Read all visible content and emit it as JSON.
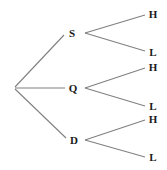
{
  "diagram": {
    "type": "probability-tree",
    "title": "",
    "background_color": "#ffffff",
    "edge_color": "#808080",
    "label_color": "#1a1a1a",
    "root": {
      "label": "",
      "x": 14,
      "y": 88
    },
    "level1": [
      {
        "id": "s",
        "label": "S",
        "x": 72,
        "y": 33,
        "fork_x": 85
      },
      {
        "id": "q",
        "label": "Q",
        "x": 73,
        "y": 88,
        "fork_x": 85
      },
      {
        "id": "d",
        "label": "D",
        "x": 74,
        "y": 140,
        "fork_x": 85
      }
    ],
    "level2": [
      {
        "id": "s-h",
        "parent": "s",
        "label": "H",
        "x": 153,
        "y": 14
      },
      {
        "id": "s-l",
        "parent": "s",
        "label": "L",
        "x": 153,
        "y": 52
      },
      {
        "id": "q-h",
        "parent": "q",
        "label": "H",
        "x": 153,
        "y": 67
      },
      {
        "id": "q-l",
        "parent": "q",
        "label": "L",
        "x": 153,
        "y": 106
      },
      {
        "id": "d-h",
        "parent": "d",
        "label": "H",
        "x": 153,
        "y": 119
      },
      {
        "id": "d-l",
        "parent": "d",
        "label": "L",
        "x": 153,
        "y": 157
      }
    ],
    "edges": [
      {
        "id": "root-s",
        "x1": 15,
        "y1": 87,
        "x2": 64,
        "y2": 35
      },
      {
        "id": "root-q",
        "x1": 15,
        "y1": 88,
        "x2": 65,
        "y2": 88
      },
      {
        "id": "root-d",
        "x1": 15,
        "y1": 89,
        "x2": 66,
        "y2": 138
      },
      {
        "id": "s-to-h",
        "x1": 85,
        "y1": 33,
        "x2": 145,
        "y2": 15
      },
      {
        "id": "s-to-l",
        "x1": 85,
        "y1": 33,
        "x2": 145,
        "y2": 51
      },
      {
        "id": "q-to-h",
        "x1": 85,
        "y1": 88,
        "x2": 145,
        "y2": 68
      },
      {
        "id": "q-to-l",
        "x1": 85,
        "y1": 88,
        "x2": 145,
        "y2": 106
      },
      {
        "id": "d-to-h",
        "x1": 85,
        "y1": 140,
        "x2": 145,
        "y2": 120
      },
      {
        "id": "d-to-l",
        "x1": 85,
        "y1": 140,
        "x2": 145,
        "y2": 157
      }
    ]
  }
}
